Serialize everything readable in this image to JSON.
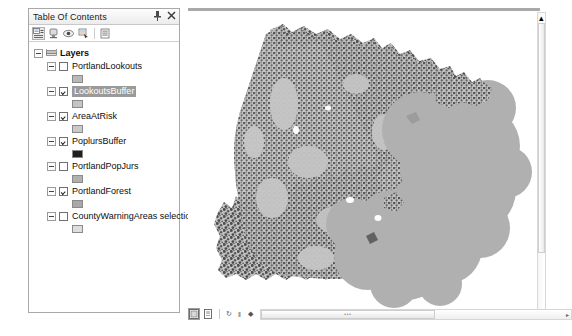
{
  "panel": {
    "title": "Table Of Contents",
    "pin_icon": "pin-icon",
    "close_icon": "close-icon",
    "toolbar": [
      {
        "name": "list-by-drawing-order-button",
        "icon": "list-by-drawing-order-icon",
        "active": true
      },
      {
        "name": "list-by-source-button",
        "icon": "list-by-source-icon",
        "active": false
      },
      {
        "name": "list-by-visibility-button",
        "icon": "list-by-visibility-icon",
        "active": false
      },
      {
        "name": "list-by-selection-button",
        "icon": "list-by-selection-icon",
        "active": false
      },
      {
        "name": "toc-options-button",
        "icon": "options-icon",
        "active": false
      }
    ]
  },
  "toc": {
    "root_label": "Layers",
    "root_icon": "layers-stack-icon",
    "layers": [
      {
        "label": "PortlandLookouts",
        "checked": false,
        "selected": false,
        "swatch": "#b9b9b9"
      },
      {
        "label": "LookoutsBuffer",
        "checked": true,
        "selected": true,
        "swatch": "#c4c4c4"
      },
      {
        "label": "AreaAtRisk",
        "checked": true,
        "selected": false,
        "swatch": "#c9c9c9"
      },
      {
        "label": "PoplursBuffer",
        "checked": true,
        "selected": false,
        "swatch": "#1f1f1f"
      },
      {
        "label": "PortlandPopJurs",
        "checked": false,
        "selected": false,
        "swatch": "#b0b0b0"
      },
      {
        "label": "PortlandForest",
        "checked": true,
        "selected": false,
        "swatch": "#a8a8a8"
      },
      {
        "label": "CountyWarningAreas selection",
        "checked": false,
        "selected": false,
        "swatch": "#dddddd"
      }
    ]
  },
  "map": {
    "forest_color": "#555555",
    "buffer_color": "#b0b0b0",
    "area_color": "#c2c2c2",
    "background": "#ffffff"
  },
  "bottombar": {
    "buttons": [
      {
        "name": "data-view-button",
        "icon": "data-view-icon",
        "active": true
      },
      {
        "name": "layout-view-button",
        "icon": "layout-view-icon",
        "active": false
      }
    ],
    "nav": [
      {
        "name": "refresh-view-button",
        "icon": "refresh-icon",
        "glyph": "↻"
      },
      {
        "name": "pause-drawing-button",
        "icon": "pause-icon",
        "glyph": "‖"
      },
      {
        "name": "zoom-whole-page-button",
        "icon": "zoom-page-icon",
        "glyph": "◆"
      }
    ],
    "scroll_grip": "•••",
    "scroll_arrow": "▸"
  },
  "scrollbar": {
    "up_arrow": "▴"
  }
}
